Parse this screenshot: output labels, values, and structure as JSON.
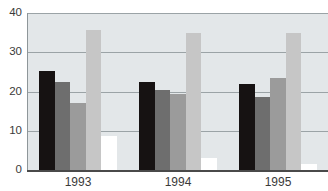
{
  "chart_data": {
    "type": "bar",
    "title": "",
    "xlabel": "",
    "ylabel": "",
    "ylim": [
      0,
      40
    ],
    "yticks": [
      0,
      10,
      20,
      30,
      40
    ],
    "grid": true,
    "legend": "none",
    "categories": [
      "1993",
      "1994",
      "1995"
    ],
    "series": [
      {
        "name": "series-1",
        "color": "#161212",
        "values": [
          25.2,
          22.4,
          21.8
        ]
      },
      {
        "name": "series-2",
        "color": "#6e6e6e",
        "values": [
          22.4,
          20.3,
          18.5
        ]
      },
      {
        "name": "series-3",
        "color": "#9b9b9b",
        "values": [
          17.0,
          19.3,
          23.5
        ]
      },
      {
        "name": "series-4",
        "color": "#c6c6c6",
        "values": [
          35.7,
          35.0,
          34.8
        ]
      },
      {
        "name": "series-5",
        "color": "#ffffff",
        "values": [
          8.7,
          3.0,
          1.5
        ]
      }
    ]
  },
  "axes": {
    "y_tick_labels": [
      "40",
      "30",
      "20",
      "10",
      "0"
    ],
    "x_tick_labels": [
      "1993",
      "1994",
      "1995"
    ]
  },
  "colors": {
    "plot_background": "#e3e7e9",
    "gridline": "#9ba3a6",
    "axis": "#4a4a4a",
    "tick_text": "#3a3a3a",
    "page_background": "#ffffff"
  }
}
